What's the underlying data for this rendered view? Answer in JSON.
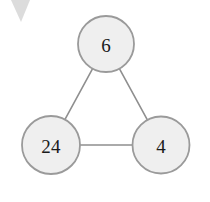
{
  "diagram": {
    "type": "number-bond-triangle",
    "background_color": "#ffffff",
    "node_fill_color": "#efefef",
    "node_border_color": "#9a9a9a",
    "edge_color": "#8f8f8f",
    "text_color": "#1a1a1a",
    "nodes": [
      {
        "id": "top",
        "label": "6",
        "cx": 106,
        "cy": 44,
        "r": 28
      },
      {
        "id": "bottom-left",
        "label": "24",
        "cx": 51,
        "cy": 145,
        "r": 29
      },
      {
        "id": "bottom-right",
        "label": "4",
        "cx": 161,
        "cy": 145,
        "r": 28.5
      }
    ],
    "edges": [
      {
        "id": "top-to-bottom-left",
        "from": "top",
        "to": "bottom-left"
      },
      {
        "id": "top-to-bottom-right",
        "from": "top",
        "to": "bottom-right"
      },
      {
        "id": "bottom-left-to-bottom-right",
        "from": "bottom-left",
        "to": "bottom-right"
      }
    ],
    "artifact": {
      "id": "corner-triangle",
      "color": "#d6d6d6",
      "points": "11,0 30,0 21,22"
    }
  }
}
